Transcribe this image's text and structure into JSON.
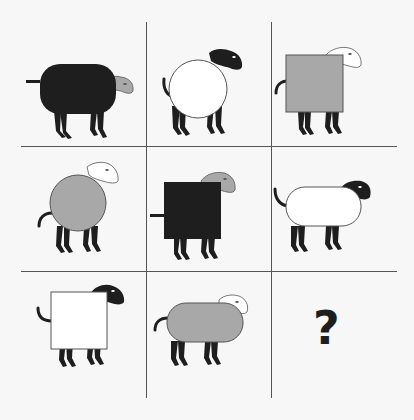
{
  "puzzle": {
    "grid": {
      "rows": 3,
      "cols": 3
    },
    "colors": {
      "black": "#1e1e1e",
      "gray": "#a8a8a8",
      "white": "#ffffff",
      "line": "#555555",
      "background": "#f7f7f7"
    },
    "cells": [
      {
        "row": 0,
        "col": 0,
        "body_shape": "rounded-rectangle",
        "body_color": "black",
        "head_color": "gray",
        "tail": "straight"
      },
      {
        "row": 0,
        "col": 1,
        "body_shape": "circle",
        "body_color": "white",
        "head_color": "black",
        "tail": "curled"
      },
      {
        "row": 0,
        "col": 2,
        "body_shape": "square",
        "body_color": "gray",
        "head_color": "white",
        "tail": "curled"
      },
      {
        "row": 1,
        "col": 0,
        "body_shape": "circle",
        "body_color": "gray",
        "head_color": "white",
        "tail": "curled"
      },
      {
        "row": 1,
        "col": 1,
        "body_shape": "square",
        "body_color": "black",
        "head_color": "gray",
        "tail": "straight"
      },
      {
        "row": 1,
        "col": 2,
        "body_shape": "rounded-rectangle",
        "body_color": "white",
        "head_color": "black",
        "tail": "curled"
      },
      {
        "row": 2,
        "col": 0,
        "body_shape": "square",
        "body_color": "white",
        "head_color": "black",
        "tail": "curled"
      },
      {
        "row": 2,
        "col": 1,
        "body_shape": "rounded-rectangle",
        "body_color": "gray",
        "head_color": "white",
        "tail": "curled"
      },
      {
        "row": 2,
        "col": 2,
        "missing": true,
        "label": "?"
      }
    ]
  }
}
